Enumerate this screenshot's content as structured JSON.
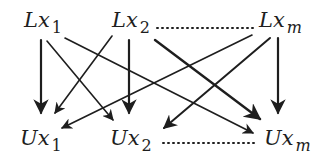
{
  "diagram": {
    "nodes_top": [
      {
        "id": "Lx1",
        "base": "Lx",
        "sub": "1"
      },
      {
        "id": "Lx2",
        "base": "Lx",
        "sub": "2"
      },
      {
        "id": "Lxm",
        "base": "Lx",
        "sub": "m"
      }
    ],
    "nodes_bottom": [
      {
        "id": "Ux1",
        "base": "Ux",
        "sub": "1"
      },
      {
        "id": "Ux2",
        "base": "Ux",
        "sub": "2"
      },
      {
        "id": "Uxm",
        "base": "Ux",
        "sub": "m"
      }
    ],
    "ellipsis_top": "Lx2 to Lxm (dotted)",
    "ellipsis_bottom": "Ux2 to Uxm (dotted)",
    "edges": [
      {
        "from": "Lx1",
        "to": "Ux1"
      },
      {
        "from": "Lx1",
        "to": "Ux2"
      },
      {
        "from": "Lx1",
        "to": "Uxm"
      },
      {
        "from": "Lx2",
        "to": "Ux1"
      },
      {
        "from": "Lx2",
        "to": "Ux2"
      },
      {
        "from": "Lx2",
        "to": "Uxm"
      },
      {
        "from": "Lxm",
        "to": "Ux1"
      },
      {
        "from": "Lxm",
        "to": "Ux2"
      },
      {
        "from": "Lxm",
        "to": "Uxm"
      }
    ],
    "stroke_color": "#1e1e1e"
  }
}
